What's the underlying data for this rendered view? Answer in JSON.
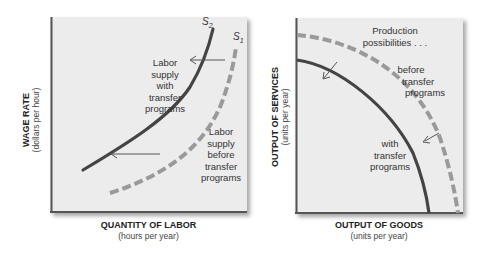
{
  "colors": {
    "panel_bg": "#ececec",
    "solid_curve": "#444444",
    "dashed_curve": "#9a9a9a",
    "axis": "#555555"
  },
  "left_chart": {
    "y_axis": {
      "title": "WAGE RATE",
      "subtitle": "(dollars per hour)"
    },
    "x_axis": {
      "title": "QUANTITY OF LABOR",
      "subtitle": "(hours per year)"
    },
    "curves": [
      {
        "id": "S2",
        "label": "S",
        "subscript": "2",
        "style": "solid"
      },
      {
        "id": "S1",
        "label": "S",
        "subscript": "1",
        "style": "dashed"
      }
    ],
    "annotations": {
      "with_transfer": [
        "Labor",
        "supply",
        "with",
        "transfer",
        "programs"
      ],
      "before_transfer": [
        "Labor",
        "supply",
        "before",
        "transfer",
        "programs"
      ]
    }
  },
  "right_chart": {
    "y_axis": {
      "title": "OUTPUT OF SERVICES",
      "subtitle": "(units per year)"
    },
    "x_axis": {
      "title": "OUTPUT OF GOODS",
      "subtitle": "(units per year)"
    },
    "annotations": {
      "heading": [
        "Production",
        "possibilities . . ."
      ],
      "before_transfer": [
        "before",
        "transfer",
        "programs"
      ],
      "with_transfer": [
        "with",
        "transfer",
        "programs"
      ]
    }
  }
}
